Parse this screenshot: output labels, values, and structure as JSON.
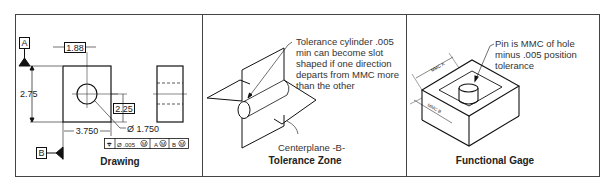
{
  "panels": [
    {
      "id": "drawing",
      "caption": "Drawing",
      "datums": {
        "a": "A",
        "b": "B"
      },
      "dimensions": {
        "hole_position_x": "1.88",
        "height": "2.75",
        "hole_position_y": "2.25",
        "width": "3.750",
        "hole_diameter": "Ø 1.750"
      },
      "feature_control_frame": {
        "symbol": "⌖",
        "tolerance": "Ø .005",
        "modifier": "M",
        "datum_1": "A",
        "datum_1_mod": "M",
        "datum_2": "B",
        "datum_2_mod": "M"
      }
    },
    {
      "id": "tolerance-zone",
      "caption": "Tolerance Zone",
      "note_lines": [
        "Tolerance cylinder .005",
        "min can become slot",
        "shaped if one direction",
        "departs from MMC more",
        "than the other"
      ],
      "label": "Centerplane -B-"
    },
    {
      "id": "functional-gage",
      "caption": "Functional Gage",
      "note_lines": [
        "Pin is MMC of hole",
        "minus .005 position",
        "tolerance"
      ],
      "dim_labels": {
        "a": "MMC A",
        "b": "MMC B"
      }
    }
  ]
}
